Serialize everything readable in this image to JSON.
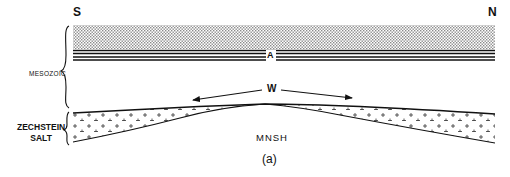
{
  "diagram": {
    "orientation": {
      "left": "S",
      "right": "N"
    },
    "units": [
      {
        "name": "MESOZOIC",
        "pattern": "stippled band over thin parallel beds"
      },
      {
        "name": "ZECHSTEIN SALT",
        "pattern": "crosses (+) in wedge"
      }
    ],
    "labels": {
      "south": "S",
      "north": "N",
      "mesozoic": "MESOZOIC",
      "zechstein_line1": "ZECHSTEIN",
      "zechstein_line2": "SALT",
      "bed_marker": "A",
      "withdrawal": "W",
      "basement": "MNSH",
      "figure_tag": "(a)"
    },
    "colors": {
      "ink": "#111111",
      "background": "#ffffff",
      "stipple": "#9a9a9a"
    }
  }
}
